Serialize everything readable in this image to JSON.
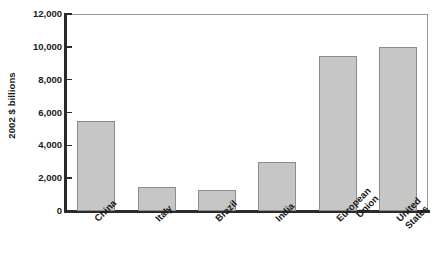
{
  "chart_data": {
    "type": "bar",
    "title": "",
    "xlabel": "",
    "ylabel": "2002 $ billions",
    "ylim": [
      0,
      12000
    ],
    "ytick_values": [
      0,
      2000,
      4000,
      6000,
      8000,
      10000,
      12000
    ],
    "ytick_labels": [
      "0",
      "2,000",
      "4,000",
      "6,000",
      "8,000",
      "10,000",
      "12,000"
    ],
    "grid": false,
    "legend": null,
    "bar_color": "#c6c6c6",
    "bar_edge_color": "#8c8c8c",
    "categories": [
      "China",
      "Italy",
      "Brazil",
      "India",
      "European Union",
      "United States"
    ],
    "category_lines": [
      [
        "China"
      ],
      [
        "Italy"
      ],
      [
        "Brazil"
      ],
      [
        "India"
      ],
      [
        "European",
        "Union"
      ],
      [
        "United",
        "States"
      ]
    ],
    "values": [
      5480,
      1460,
      1280,
      3000,
      9440,
      9990
    ]
  },
  "axis": {
    "y_title": "2002 $ billions"
  }
}
